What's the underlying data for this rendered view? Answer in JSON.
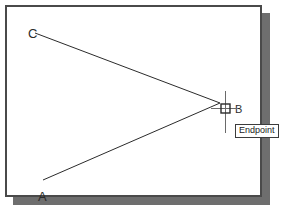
{
  "app": {
    "type": "cad-drawing-viewport",
    "background_color": "#ffffff",
    "frame_border_color": "#4a4a4a",
    "shadow_color": "#6e6e6e",
    "geometry_color": "#2b2b2b"
  },
  "drawing": {
    "labels": {
      "c": "C",
      "a": "A",
      "b": "B"
    },
    "points": {
      "C": {
        "x": 28,
        "y": 26,
        "label": "C"
      },
      "A": {
        "x": 36,
        "y": 183,
        "label": "A"
      },
      "B": {
        "x": 213,
        "y": 96,
        "label": "B"
      }
    },
    "lines": [
      {
        "name": "line-c-b",
        "from": "C",
        "to": "B",
        "x1": 28,
        "y1": 26,
        "x2": 213,
        "y2": 96
      },
      {
        "name": "line-a-b",
        "from": "A",
        "to": "B",
        "x1": 36,
        "y1": 173,
        "x2": 213,
        "y2": 96
      }
    ]
  },
  "cursor": {
    "type": "crosshair-with-aperture",
    "x": 213,
    "y": 96,
    "aperture_size": 9,
    "crosshair_color": "#6a6a6a"
  },
  "osnap": {
    "marker": "endpoint-square",
    "tooltip_label": "Endpoint",
    "tooltip_border_color": "#3c3c3c",
    "tooltip_background": "#ffffff"
  }
}
